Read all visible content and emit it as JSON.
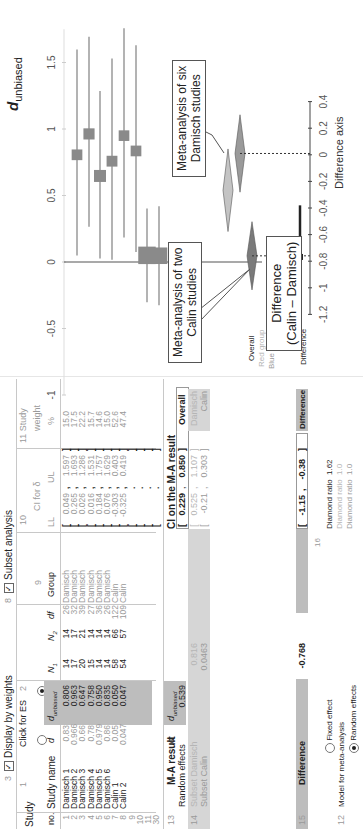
{
  "header": {
    "study_label": "Study",
    "no_label": "no.",
    "study_name_label": "Study name",
    "col1_num": "1",
    "click_for_es": "Click for ES",
    "col2_num": "2",
    "col3_num": "3",
    "display_by_weights": "Display by weights",
    "col8_num": "8",
    "subset_analysis": "Subset analysis",
    "col9_num": "9",
    "col10_num": "10",
    "ci_for_delta": "CI for δ",
    "col11_label": "11 Study",
    "weight_label": "weight",
    "pct_label": "%",
    "d_label": "d",
    "d_unbiased_label": "d",
    "d_unbiased_sub": "unbiased",
    "n1_label": "N",
    "n1_sub": "1",
    "n2_label": "N",
    "n2_sub": "2",
    "df_label": "df",
    "group_label": "Group",
    "ll_label": "LL",
    "ul_label": "UL"
  },
  "studies": [
    {
      "no": "1",
      "name": "Damisch 1",
      "d": "0.83",
      "d_unb": "0.806",
      "n1": "14",
      "n2": "14",
      "df": "26",
      "group": "Damisch",
      "ll": "0.049",
      "ul": "1.597",
      "weight": "15.0"
    },
    {
      "no": "2",
      "name": "Damisch 2",
      "d": "0.966",
      "d_unb": "0.963",
      "n1": "17",
      "n2": "17",
      "df": "32",
      "group": "Damisch",
      "ll": "0.265",
      "ul": "1.693",
      "weight": "17.5"
    },
    {
      "no": "3",
      "name": "Damisch 3",
      "d": "0.66",
      "d_unb": "0.647",
      "n1": "20",
      "n2": "21",
      "df": "39",
      "group": "Damisch",
      "ll": "0.026",
      "ul": "1.286",
      "weight": "22.2"
    },
    {
      "no": "4",
      "name": "Damisch 4",
      "d": "0.78",
      "d_unb": "0.758",
      "n1": "15",
      "n2": "14",
      "df": "27",
      "group": "Damisch",
      "ll": "0.016",
      "ul": "1.531",
      "weight": "15.7"
    },
    {
      "no": "5",
      "name": "Damisch 5",
      "d": "0.979",
      "d_unb": "0.950",
      "n1": "14",
      "n2": "14",
      "df": "36",
      "group": "Damisch",
      "ll": "0.184",
      "ul": "1.757",
      "weight": "14.6"
    },
    {
      "no": "6",
      "name": "Damisch 6",
      "d": "0.86",
      "d_unb": "0.835",
      "n1": "14",
      "n2": "14",
      "df": "26",
      "group": "Damisch",
      "ll": "0.076",
      "ul": "1.629",
      "weight": "15.0"
    },
    {
      "no": "7",
      "name": "Calin 1",
      "d": "0.05",
      "d_unb": "0.050",
      "n1": "58",
      "n2": "66",
      "df": "122",
      "group": "Calin",
      "ll": "-0.303",
      "ul": "0.403",
      "weight": "52.6"
    },
    {
      "no": "8",
      "name": "Calin 2",
      "d": "0.047",
      "d_unb": "0.047",
      "n1": "54",
      "n2": "57",
      "df": "109",
      "group": "Calin",
      "ll": "-0.325",
      "ul": "0.419",
      "weight": "47.4"
    },
    {
      "no": "9",
      "name": "",
      "d": "",
      "d_unb": "",
      "n1": "",
      "n2": "",
      "df": "",
      "group": "",
      "ll": "",
      "ul": "",
      "weight": ""
    },
    {
      "no": "10",
      "name": "",
      "d": "",
      "d_unb": "",
      "n1": "",
      "n2": "",
      "df": "",
      "group": "",
      "ll": "",
      "ul": "",
      "weight": ""
    },
    {
      "no": "11",
      "name": "",
      "d": "",
      "d_unb": "",
      "n1": "",
      "n2": "",
      "df": "",
      "group": "",
      "ll": "",
      "ul": "",
      "weight": ""
    },
    {
      "no": "30",
      "name": "",
      "d": "",
      "d_unb": "",
      "n1": "",
      "n2": "",
      "df": "",
      "group": "",
      "ll": "",
      "ul": "",
      "weight": ""
    }
  ],
  "ma_result": {
    "num": "13",
    "title": "M-A result",
    "d_label": "d",
    "d_unb_label": "d",
    "d_unb_sub": "unbiased",
    "random_effects_label": "Random effects",
    "random_effects_value": "0.539",
    "ci_title": "CI on the M-A result",
    "overall_ll": "0.229",
    "overall_ul": "0.850",
    "overall_label": "Overall"
  },
  "subsets": {
    "num": "14",
    "damisch_label": "Subset Damisch",
    "damisch_value": "0.816",
    "damisch_ll": "0.525",
    "damisch_ul": "1.107",
    "damisch_tag": "Damisch",
    "calin_label": "Subset Calin",
    "calin_value": "0.0463",
    "calin_ll": "-0.21",
    "calin_ul": "0.303",
    "calin_tag": "Calin"
  },
  "difference": {
    "num": "15",
    "label": "Difference",
    "value": "-0.768",
    "ll": "-1.15",
    "ul": "-0.38",
    "tag": "Difference"
  },
  "model": {
    "num": "12",
    "label": "Model for meta-analysis",
    "fixed": "Fixed effect",
    "random": "Random effects",
    "selected": "Random effects"
  },
  "diamond_ratio": {
    "num": "16",
    "rows": [
      {
        "label": "Diamond ratio",
        "value": "1.62"
      },
      {
        "label": "Diamond ratio",
        "value": "1.0"
      },
      {
        "label": "Diamond ratio",
        "value": "1.0"
      }
    ]
  },
  "plot": {
    "legend": [
      "Overall",
      "Red group",
      "Blue group",
      "Difference"
    ],
    "axis_title": "d",
    "axis_title_sub": "unbiased",
    "ticks": [
      "-1",
      "-0.5",
      "0",
      "0.5",
      "1",
      "1.5"
    ],
    "diff_axis_title": "Difference axis",
    "diff_ticks": [
      "-1.2",
      "-1",
      "-0.8",
      "-0.6",
      "-0.4",
      "-0.2",
      "0",
      "0.2",
      "0.4"
    ],
    "callout_damisch": "Meta-analysis of six\nDamisch studies",
    "callout_calin": "Meta-analysis of two\nCalin studies",
    "callout_diff": "Difference\n(Calin – Damisch)",
    "colors": {
      "study_square": "#8a8a8a",
      "ci_line": "#9a9a9a",
      "overall_diamond": "#7a7a7a",
      "damisch_diamond": "#9a9a9a",
      "calin_diamond": "#c4c4c4",
      "difference": "#222222"
    }
  },
  "chart_data": {
    "type": "forest",
    "title": "",
    "xlabel": "d_unbiased",
    "xlim": [
      -1,
      1.75
    ],
    "ticks": [
      -1,
      -0.5,
      0,
      0.5,
      1,
      1.5
    ],
    "studies": [
      {
        "name": "Damisch 1",
        "estimate": 0.806,
        "ll": 0.049,
        "ul": 1.597,
        "weight": 15.0
      },
      {
        "name": "Damisch 2",
        "estimate": 0.963,
        "ll": 0.265,
        "ul": 1.693,
        "weight": 17.5
      },
      {
        "name": "Damisch 3",
        "estimate": 0.647,
        "ll": 0.026,
        "ul": 1.286,
        "weight": 22.2
      },
      {
        "name": "Damisch 4",
        "estimate": 0.758,
        "ll": 0.016,
        "ul": 1.531,
        "weight": 15.7
      },
      {
        "name": "Damisch 5",
        "estimate": 0.95,
        "ll": 0.184,
        "ul": 1.757,
        "weight": 14.6
      },
      {
        "name": "Damisch 6",
        "estimate": 0.835,
        "ll": 0.076,
        "ul": 1.629,
        "weight": 15.0
      },
      {
        "name": "Calin 1",
        "estimate": 0.05,
        "ll": -0.303,
        "ul": 0.403,
        "weight": 52.6
      },
      {
        "name": "Calin 2",
        "estimate": 0.047,
        "ll": -0.325,
        "ul": 0.419,
        "weight": 47.4
      }
    ],
    "summaries": [
      {
        "name": "Overall",
        "estimate": 0.539,
        "ll": 0.229,
        "ul": 0.85
      },
      {
        "name": "Damisch (Red group)",
        "estimate": 0.816,
        "ll": 0.525,
        "ul": 1.107
      },
      {
        "name": "Calin (Blue group)",
        "estimate": 0.0463,
        "ll": -0.21,
        "ul": 0.303
      }
    ],
    "difference": {
      "estimate": -0.768,
      "ll": -1.15,
      "ul": -0.38
    },
    "difference_axis": {
      "label": "Difference axis",
      "ticks": [
        -1.2,
        -1,
        -0.8,
        -0.6,
        -0.4,
        -0.2,
        0,
        0.2,
        0.4
      ]
    },
    "annotations": [
      "Meta-analysis of six Damisch studies",
      "Meta-analysis of two Calin studies",
      "Difference (Calin – Damisch)"
    ]
  }
}
